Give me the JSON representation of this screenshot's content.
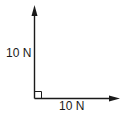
{
  "diagram": {
    "type": "force-vector-diagram",
    "vectors": [
      {
        "id": "vertical",
        "direction": "up",
        "magnitude_label": "10 N"
      },
      {
        "id": "horizontal",
        "direction": "right",
        "magnitude_label": "10 N"
      }
    ],
    "right_angle_marker": true,
    "colors": {
      "stroke": "#1a1a1a",
      "background": "#ffffff"
    }
  }
}
